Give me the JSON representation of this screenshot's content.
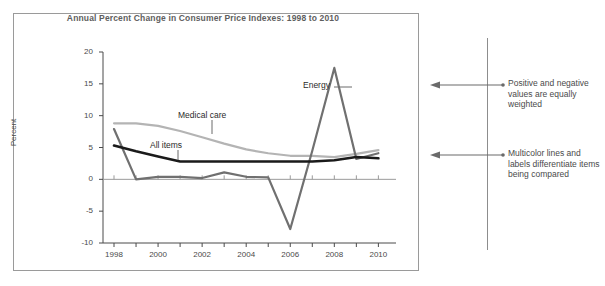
{
  "chart_data": {
    "type": "line",
    "title": "Annual Percent Change in Consumer Price Indexes: 1998 to 2010",
    "xlabel": "",
    "ylabel": "Percent",
    "x": [
      1998,
      1999,
      2000,
      2001,
      2002,
      2003,
      2004,
      2005,
      2006,
      2007,
      2008,
      2009,
      2010
    ],
    "xlim": [
      1997.5,
      2010.8
    ],
    "ylim": [
      -10,
      20
    ],
    "yticks": [
      -10,
      -5,
      0,
      5,
      10,
      15,
      20
    ],
    "ytick_labels": [
      "-10",
      "-5",
      "0",
      "5",
      "10",
      "15",
      "20"
    ],
    "xticks": [
      1998,
      1999,
      2000,
      2001,
      2002,
      2003,
      2004,
      2005,
      2006,
      2007,
      2008,
      2009,
      2010
    ],
    "xtick_labels": [
      "1998",
      "",
      "2000",
      "",
      "2002",
      "",
      "2004",
      "",
      "2006",
      "",
      "2008",
      "",
      "2010"
    ],
    "grid": false,
    "legend_position": "inline-labels",
    "series": [
      {
        "name": "Medical care",
        "color": "#b4b4b4",
        "values": [
          8.8,
          8.8,
          8.4,
          7.6,
          6.6,
          5.6,
          4.7,
          4.1,
          3.7,
          3.7,
          3.5,
          4.0,
          4.6
        ]
      },
      {
        "name": "All items",
        "color": "#1a1a1a",
        "values": [
          5.3,
          4.4,
          3.6,
          2.8,
          2.8,
          2.8,
          2.8,
          2.8,
          2.8,
          2.8,
          3.0,
          3.5,
          3.3
        ]
      },
      {
        "name": "Energy",
        "color": "#707070",
        "values": [
          7.9,
          0.0,
          0.4,
          0.4,
          0.2,
          1.1,
          0.4,
          0.3,
          -7.8,
          4.5,
          17.5,
          3.2,
          4.1
        ]
      }
    ],
    "annotations": [
      {
        "text": "Energy",
        "series": "Energy"
      },
      {
        "text": "Medical care",
        "series": "Medical care"
      },
      {
        "text": "All items",
        "series": "All items"
      }
    ]
  },
  "callouts": [
    {
      "text": "Positive and negative values are equally weighted"
    },
    {
      "text": "Multicolor lines and labels differentiate items being compared"
    }
  ]
}
